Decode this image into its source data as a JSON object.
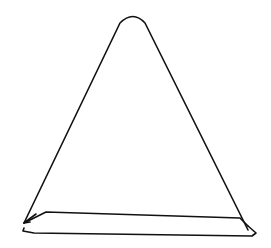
{
  "drawing": {
    "subject": "triangle-sketch",
    "stroke_color": "#111111",
    "background_color": "#ffffff",
    "stroke_width": 1.6
  }
}
